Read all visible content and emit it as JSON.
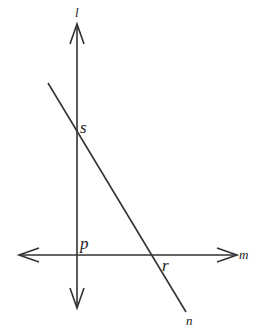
{
  "diagram": {
    "type": "geometry-lines",
    "stroke_color": "#333333",
    "lines": [
      {
        "name": "l",
        "label": "l",
        "kind": "line (double-arrow)",
        "orientation": "vertical"
      },
      {
        "name": "m",
        "label": "m",
        "kind": "line (double-arrow)",
        "orientation": "horizontal"
      },
      {
        "name": "n",
        "label": "n",
        "kind": "segment/transversal",
        "orientation": "diagonal"
      }
    ],
    "points": [
      {
        "name": "s",
        "label": "s",
        "on": [
          "l",
          "n"
        ]
      },
      {
        "name": "p",
        "label": "p",
        "on": [
          "l",
          "m"
        ]
      },
      {
        "name": "r",
        "label": "r",
        "on": [
          "m",
          "n"
        ]
      }
    ]
  },
  "labels": {
    "l": "l",
    "m": "m",
    "n": "n",
    "s": "s",
    "p": "p",
    "r": "r"
  }
}
